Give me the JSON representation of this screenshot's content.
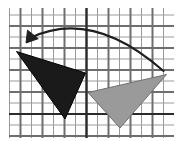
{
  "figure": {
    "width": 176,
    "height": 141,
    "background_color": "#ffffff"
  },
  "colors": {
    "background": "#ffffff",
    "minor_grid": "#9b9b9b",
    "major_grid": "#6e6e6e",
    "axis": "#2b2b2b",
    "preimage_fill": "#1a1a1a",
    "image_fill": "#9a9a9a",
    "image_stroke": "#6f6f6f",
    "arrow": "#1f1f1f"
  },
  "grid": {
    "label": "square coordinate grid",
    "origin_x": 86.5,
    "origin_y": 114.0,
    "cell_size": 11.0,
    "left": 9,
    "top": 8,
    "right": 174,
    "bottom": 138,
    "minor_line_width": 1,
    "major_line_width": 2,
    "show_minor": true,
    "show_major": true
  },
  "axes": {
    "x_axis": {
      "name": "x-axis",
      "y_pixel": 114,
      "x_start": 9,
      "x_end": 174,
      "line_width": 2.2
    },
    "y_axis": {
      "name": "y-axis",
      "x_pixel": 86.5,
      "y_start": 8,
      "y_end": 138,
      "line_width": 2.2
    }
  },
  "shapes": [
    {
      "id": "preimage-triangle",
      "name": "dark triangle",
      "role": "image",
      "fill": "#1a1a1a",
      "stroke": "#000000",
      "stroke_width": 1,
      "points_px": [
        [
          16.5,
          51.5
        ],
        [
          85.5,
          73.0
        ],
        [
          65.0,
          119.0
        ]
      ],
      "points_grid": [
        [
          -6.4,
          5.7
        ],
        [
          -0.1,
          3.7
        ],
        [
          -2.0,
          -0.5
        ]
      ]
    },
    {
      "id": "image-triangle",
      "name": "gray triangle",
      "role": "preimage",
      "fill": "#9a9a9a",
      "stroke": "#707070",
      "stroke_width": 1,
      "points_px": [
        [
          88.0,
          92.5
        ],
        [
          166.5,
          74.5
        ],
        [
          120.0,
          128.0
        ]
      ],
      "points_grid": [
        [
          0.1,
          2.0
        ],
        [
          7.3,
          3.6
        ],
        [
          3.0,
          -1.3
        ]
      ]
    }
  ],
  "arrow": {
    "id": "transformation-arrow",
    "name": "curved transformation arrow",
    "color": "#1f1f1f",
    "stroke_width": 2.1,
    "start_px": [
      163.5,
      71.0
    ],
    "control_px": [
      92.0,
      8.0
    ],
    "end_px": [
      30.0,
      38.0
    ],
    "head_px": [
      26.0,
      43.0
    ],
    "head_size": 11,
    "direction": "right-to-left",
    "description": "arc from gray triangle to dark triangle"
  }
}
